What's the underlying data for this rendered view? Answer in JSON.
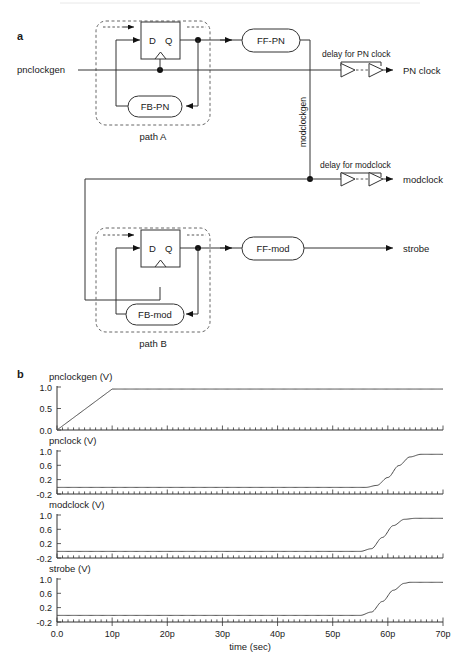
{
  "figure": {
    "panel_a_letter": "a",
    "panel_b_letter": "b"
  },
  "diagram": {
    "input_label": "pnclockgen",
    "path_a_label": "path A",
    "path_b_label": "path B",
    "vertical_net_label": "modclockgen",
    "ff_d_label": "D",
    "ff_q_label": "Q",
    "blocks": [
      {
        "name": "FB-PN",
        "label": "FB-PN"
      },
      {
        "name": "FF-PN",
        "label": "FF-PN"
      },
      {
        "name": "FB-mod",
        "label": "FB-mod"
      },
      {
        "name": "FF-mod",
        "label": "FF-mod"
      }
    ],
    "delays": [
      {
        "name": "delay-pn-clock",
        "label": "delay for PN clock",
        "output": "PN clock"
      },
      {
        "name": "delay-modclock",
        "label": "delay for modclock",
        "output": "modclock"
      }
    ],
    "outputs": [
      {
        "name": "pn-clock",
        "label": "PN clock"
      },
      {
        "name": "modclock",
        "label": "modclock"
      },
      {
        "name": "strobe",
        "label": "strobe"
      }
    ]
  },
  "chart_data": [
    {
      "type": "line",
      "name": "pnclockgen",
      "title": "pnclockgen (V)",
      "xlabel": "",
      "ylabel": "pnclockgen (V)",
      "xlim": [
        0,
        70
      ],
      "ylim": [
        0.0,
        1.05
      ],
      "yticks": [
        "0.0",
        "0.5",
        "1.0"
      ],
      "ytickvals": [
        0.0,
        0.5,
        1.0
      ],
      "grid": false,
      "x": [
        0,
        2,
        4,
        6,
        8,
        10,
        12,
        20,
        30,
        40,
        50,
        60,
        70
      ],
      "y": [
        0.0,
        0.2,
        0.4,
        0.6,
        0.8,
        1.0,
        1.0,
        1.0,
        1.0,
        1.0,
        1.0,
        1.0,
        1.0
      ]
    },
    {
      "type": "line",
      "name": "pnclock",
      "title": "pnclock (V)",
      "xlabel": "",
      "ylabel": "pnclock (V)",
      "xlim": [
        0,
        70
      ],
      "ylim": [
        -0.2,
        1.1
      ],
      "yticks": [
        "-0.2",
        "0.2",
        "0.6",
        "1.0"
      ],
      "ytickvals": [
        -0.2,
        0.2,
        0.6,
        1.0
      ],
      "grid": false,
      "x": [
        0,
        10,
        20,
        30,
        40,
        50,
        56,
        58,
        60,
        62,
        64,
        66,
        68,
        70
      ],
      "y": [
        0.0,
        0.0,
        0.0,
        0.0,
        0.0,
        0.0,
        0.0,
        0.06,
        0.3,
        0.66,
        0.92,
        1.0,
        1.0,
        1.0
      ]
    },
    {
      "type": "line",
      "name": "modclock",
      "title": "modclock (V)",
      "xlabel": "",
      "ylabel": "modclock (V)",
      "xlim": [
        0,
        70
      ],
      "ylim": [
        -0.2,
        1.1
      ],
      "yticks": [
        "-0.2",
        "0.2",
        "0.6",
        "1.0"
      ],
      "ytickvals": [
        -0.2,
        0.2,
        0.6,
        1.0
      ],
      "grid": false,
      "x": [
        0,
        10,
        20,
        30,
        40,
        50,
        55,
        57,
        59,
        61,
        63,
        65,
        67,
        70
      ],
      "y": [
        0.0,
        0.0,
        0.0,
        0.0,
        0.0,
        0.0,
        0.0,
        0.08,
        0.42,
        0.78,
        0.97,
        1.0,
        1.0,
        1.0
      ]
    },
    {
      "type": "line",
      "name": "strobe",
      "title": "strobe (V)",
      "xlabel": "time (sec)",
      "ylabel": "strobe (V)",
      "xlim": [
        0,
        70
      ],
      "ylim": [
        -0.2,
        1.1
      ],
      "yticks": [
        "-0.2",
        "0.2",
        "0.6",
        "1.0"
      ],
      "ytickvals": [
        -0.2,
        0.2,
        0.6,
        1.0
      ],
      "xticks": [
        "0.0",
        "10p",
        "20p",
        "30p",
        "40p",
        "50p",
        "60p",
        "70p"
      ],
      "xtickvals": [
        0,
        10,
        20,
        30,
        40,
        50,
        60,
        70
      ],
      "grid": false,
      "x": [
        0,
        10,
        20,
        30,
        40,
        50,
        55,
        57,
        59,
        61,
        63,
        64,
        66,
        70
      ],
      "y": [
        0.0,
        0.0,
        0.0,
        0.0,
        0.0,
        0.0,
        0.0,
        0.1,
        0.42,
        0.76,
        0.97,
        1.0,
        1.0,
        1.0
      ]
    }
  ],
  "axis": {
    "xlabel": "time (sec)",
    "xticks": [
      "0.0",
      "10p",
      "20p",
      "30p",
      "40p",
      "50p",
      "60p",
      "70p"
    ]
  },
  "colors": {
    "ink": "#1a1a1a",
    "wire": "#333333",
    "curve": "#4a4a4a",
    "background": "#ffffff"
  }
}
